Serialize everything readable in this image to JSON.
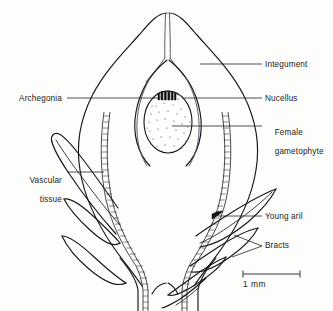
{
  "figure": {
    "background_color": "#fdfdfc",
    "ink_color": "#16161a",
    "text_color": "#1b1b20"
  },
  "labels": {
    "integument": "Integument",
    "nucellus": "Nucellus",
    "female_gametophyte_line1": "Female",
    "female_gametophyte_line2": "gametophyte",
    "young_aril": "Young aril",
    "bracts": "Bracts",
    "archegonia": "Archegonia",
    "vascular_line1": "Vascular",
    "vascular_line2": "tissue"
  },
  "scale_bar": {
    "label": "1 mm",
    "length_px": 57
  },
  "structures": [
    {
      "name": "integument",
      "description": "outer ovoid body wall"
    },
    {
      "name": "micropyle-canal",
      "description": "narrow apical canal"
    },
    {
      "name": "nucellus",
      "description": "inner chamber enclosing gametophyte"
    },
    {
      "name": "female-gametophyte",
      "description": "stippled oval body"
    },
    {
      "name": "archegonia",
      "description": "dark marks at gametophyte apex"
    },
    {
      "name": "vascular-tissue",
      "description": "ladder-hatched strands"
    },
    {
      "name": "bracts",
      "description": "lance-shaped appendages both sides"
    },
    {
      "name": "young-aril",
      "description": "collar at ovule base right side"
    }
  ]
}
